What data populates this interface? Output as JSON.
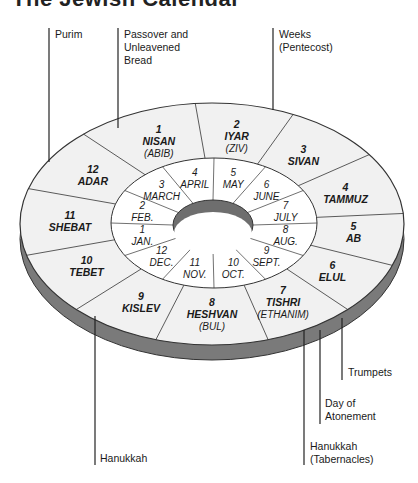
{
  "title": "The Jewish Calendar",
  "colors": {
    "face": "#f1f1f1",
    "inner_face": "#ffffff",
    "side": "#7a7a7a",
    "stroke": "#333333",
    "hole_side": "#6e6e6e",
    "text": "#1a1a1a"
  },
  "hebrew_months": [
    {
      "num": "1",
      "name": "NISAN",
      "alt": "(ABIB)"
    },
    {
      "num": "2",
      "name": "IYAR",
      "alt": "(ZIV)"
    },
    {
      "num": "3",
      "name": "SIVAN",
      "alt": ""
    },
    {
      "num": "4",
      "name": "TAMMUZ",
      "alt": ""
    },
    {
      "num": "5",
      "name": "AB",
      "alt": ""
    },
    {
      "num": "6",
      "name": "ELUL",
      "alt": ""
    },
    {
      "num": "7",
      "name": "TISHRI",
      "alt": "(ETHANIM)"
    },
    {
      "num": "8",
      "name": "HESHVAN",
      "alt": "(BUL)"
    },
    {
      "num": "9",
      "name": "KISLEV",
      "alt": ""
    },
    {
      "num": "10",
      "name": "TEBET",
      "alt": ""
    },
    {
      "num": "11",
      "name": "SHEBAT",
      "alt": ""
    },
    {
      "num": "12",
      "name": "ADAR",
      "alt": ""
    }
  ],
  "gregorian_months": [
    {
      "num": "3",
      "name": "MARCH"
    },
    {
      "num": "4",
      "name": "APRIL"
    },
    {
      "num": "5",
      "name": "MAY"
    },
    {
      "num": "6",
      "name": "JUNE"
    },
    {
      "num": "7",
      "name": "JULY"
    },
    {
      "num": "8",
      "name": "AUG."
    },
    {
      "num": "9",
      "name": "SEPT."
    },
    {
      "num": "10",
      "name": "OCT."
    },
    {
      "num": "11",
      "name": "NOV."
    },
    {
      "num": "12",
      "name": "DEC."
    },
    {
      "num": "1",
      "name": "JAN."
    },
    {
      "num": "2",
      "name": "FEB."
    }
  ],
  "festivals": {
    "purim": "Purim",
    "passover": "Passover and\nUnleavened\nBread",
    "weeks": "Weeks\n(Pentecost)",
    "trumpets": "Trumpets",
    "atonement": "Day of\nAtonement",
    "tabernacles": "Hanukkah\n(Tabernacles)",
    "hanukkah": "Hanukkah"
  }
}
